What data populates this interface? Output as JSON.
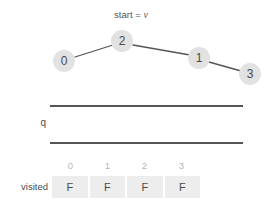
{
  "graph": {
    "start_label_prefix": "start = ",
    "start_label_var": "v",
    "nodes": [
      {
        "id": "node-0",
        "label": "0",
        "cx": 64,
        "cy": 61
      },
      {
        "id": "node-2",
        "label": "2",
        "cx": 122,
        "cy": 41
      },
      {
        "id": "node-1",
        "label": "1",
        "cx": 199,
        "cy": 58
      },
      {
        "id": "node-3",
        "label": "3",
        "cx": 250,
        "cy": 74
      }
    ],
    "edges": [
      {
        "from": "0",
        "to": "2",
        "x1": 75,
        "y1": 57,
        "x2": 113,
        "y2": 45
      },
      {
        "from": "2",
        "to": "1",
        "x1": 133,
        "y1": 45,
        "x2": 190,
        "y2": 55
      },
      {
        "from": "1",
        "to": "3",
        "x1": 209,
        "y1": 62,
        "x2": 241,
        "y2": 71
      }
    ],
    "node_fill": "#e2e2e2",
    "node_text_color": "#4a4a4a",
    "edge_color": "#555555"
  },
  "queue": {
    "label": "q",
    "items": [],
    "rail_color": "#555555"
  },
  "visited": {
    "label": "visited",
    "indices": [
      "0",
      "1",
      "2",
      "3"
    ],
    "values": [
      "F",
      "F",
      "F",
      "F"
    ],
    "cell_fill": "#ededed",
    "index_color": "#b6b6b6"
  }
}
